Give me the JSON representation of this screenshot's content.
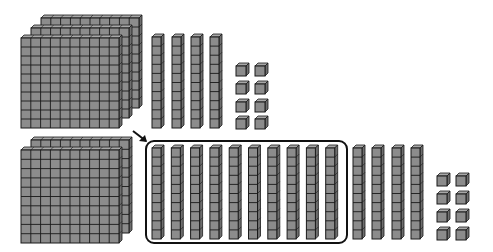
{
  "figure": {
    "colors": {
      "block_fill": "#8c8c8c",
      "block_top": "#a8a8a8",
      "block_side": "#6e6e6e",
      "grid_line": "#1a1a1a",
      "outline": "#111111"
    }
  },
  "top_group": {
    "hundreds": 3,
    "tens": 4,
    "ones": 8
  },
  "bottom_group": {
    "hundreds": 2,
    "tens_circled": 10,
    "tens_extra": 4,
    "ones": 8,
    "arrow": "points to circled group of ten tens"
  }
}
